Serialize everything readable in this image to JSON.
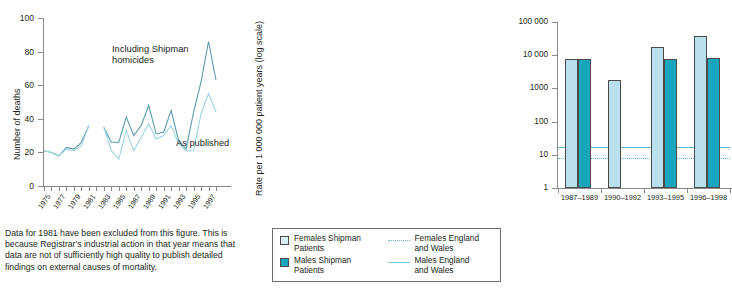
{
  "chart_data": [
    {
      "type": "line",
      "title": "",
      "xlabel": "",
      "ylabel": "Number of deaths",
      "ylim": [
        0,
        100
      ],
      "yticks": [
        0,
        20,
        40,
        60,
        80,
        100
      ],
      "grid": false,
      "x": [
        1975,
        1976,
        1977,
        1978,
        1979,
        1980,
        1981,
        1982,
        1983,
        1984,
        1985,
        1986,
        1987,
        1988,
        1989,
        1990,
        1991,
        1992,
        1993,
        1994,
        1995,
        1996,
        1997,
        1998
      ],
      "xticklabels": [
        "1975",
        "1977",
        "1979",
        "1981",
        "1983",
        "1985",
        "1987",
        "1989",
        "1991",
        "1993",
        "1995",
        "1997"
      ],
      "series": [
        {
          "name": "Including Shipman homicides",
          "color": "#5b9bb0",
          "values": [
            21,
            20,
            18,
            23,
            22,
            26,
            36,
            null,
            35,
            26,
            26,
            41,
            30,
            36,
            48,
            31,
            32,
            45,
            27,
            22,
            44,
            62,
            86,
            63
          ]
        },
        {
          "name": "As published",
          "color": "#9fd3e3",
          "values": [
            21,
            20,
            18,
            22,
            21,
            24,
            36,
            null,
            35,
            21,
            16,
            33,
            21,
            29,
            37,
            28,
            30,
            36,
            25,
            21,
            21,
            43,
            55,
            44
          ]
        }
      ],
      "annotations": [
        {
          "text": "Including Shipman",
          "x": 1983,
          "y": 74
        },
        {
          "text": "homicides",
          "x": 1983,
          "y": 68
        },
        {
          "text": "As published",
          "x": 1994,
          "y": 30
        }
      ],
      "footnote": "Data for 1981 have been excluded from this figure. This is because Registrar's industrial action in that year means that data are not of sufficiently high quality to publish detailed findings on external causes of mortality."
    },
    {
      "type": "bar",
      "title": "",
      "xlabel": "",
      "ylabel": "Rate per 1 000 000 patient years (log scale)",
      "log": true,
      "ylim": [
        1,
        100000
      ],
      "yticks": [
        1,
        10,
        100,
        1000,
        10000,
        100000
      ],
      "yticklabels": [
        "1",
        "10",
        "100",
        "1000",
        "10 000",
        "100 000"
      ],
      "categories": [
        "1987–1989",
        "1990–1992",
        "1993–1995",
        "1996–1998"
      ],
      "series": [
        {
          "name": "Females Shipman Patients",
          "color": "#b9e0ec",
          "values": [
            7500,
            1800,
            18000,
            38000
          ]
        },
        {
          "name": "Males Shipman Patients",
          "color": "#18a6bd",
          "values": [
            7600,
            null,
            7900,
            8000
          ]
        }
      ],
      "reference_lines": [
        {
          "name": "Females England and Wales",
          "value": 8,
          "style": "dotted",
          "color": "#5ab9d6"
        },
        {
          "name": "Males England and Wales",
          "value": 17,
          "style": "solid",
          "color": "#5ab9d6"
        }
      ]
    }
  ],
  "left_chart": {
    "y_axis_title": "Number of deaths",
    "y_ticks": [
      "100",
      "80",
      "60",
      "40",
      "20",
      "0"
    ],
    "x_ticks": [
      "1975",
      "1977",
      "1979",
      "1981",
      "1983",
      "1985",
      "1987",
      "1989",
      "1991",
      "1993",
      "1995",
      "1997"
    ],
    "annotation_1_line1": "Including Shipman",
    "annotation_1_line2": "homicides",
    "annotation_2": "As published",
    "caption": "Data for 1981 have been excluded from this figure. This is because Registrar's industrial action in that year means that data are not of sufficiently high quality to publish detailed findings on external causes of mortality."
  },
  "right_chart": {
    "y_axis_title": "Rate per 1 000 000 patient years (log scale)",
    "y_ticks": [
      "100 000",
      "10 000",
      "1000",
      "100",
      "10",
      "1"
    ],
    "x_ticks": [
      "1987–1989",
      "1990–1992",
      "1993–1995",
      "1996–1998"
    ]
  },
  "legend": {
    "items": [
      {
        "label_line1": "Females Shipman",
        "label_line2": "Patients",
        "swatch": "female-swatch",
        "kind": "box"
      },
      {
        "label_line1": "Females England",
        "label_line2": "and Wales",
        "swatch": "dotted-line-swatch",
        "kind": "line"
      },
      {
        "label_line1": "Males Shipman",
        "label_line2": "Patients",
        "swatch": "male-swatch",
        "kind": "box"
      },
      {
        "label_line1": "Males England",
        "label_line2": "and Wales",
        "swatch": "solid-line-swatch",
        "kind": "line"
      }
    ]
  },
  "colors": {
    "female_bar": "#b9e0ec",
    "male_bar": "#18a6bd",
    "line_including": "#5b9bb0",
    "line_published": "#9fd3e3",
    "reference_line": "#5ab9d6",
    "axis": "#8a8a8a",
    "text": "#231f20"
  }
}
